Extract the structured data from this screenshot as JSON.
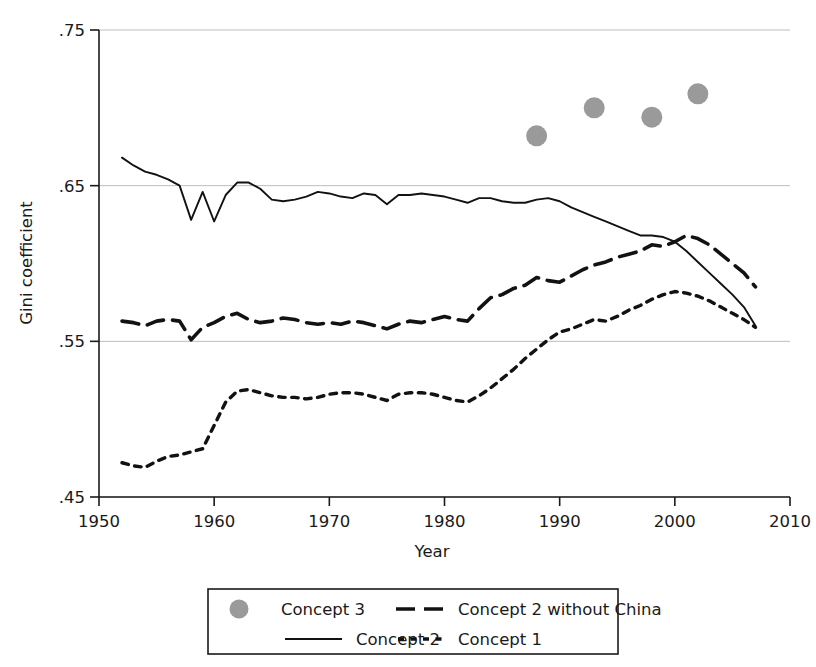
{
  "chart_data": {
    "type": "line",
    "title": "",
    "xlabel": "Year",
    "ylabel": "Gini coefficient",
    "xlim": [
      1950,
      2010
    ],
    "ylim": [
      0.45,
      0.75
    ],
    "xticks": [
      1950,
      1960,
      1970,
      1980,
      1990,
      2000,
      2010
    ],
    "xtick_labels": [
      "1950",
      "1960",
      "1970",
      "1980",
      "1990",
      "2000",
      "2010"
    ],
    "yticks": [
      0.45,
      0.55,
      0.65,
      0.75
    ],
    "ytick_labels": [
      ".45",
      ".55",
      ".65",
      ".75"
    ],
    "grid": "horizontal",
    "legend_position": "below-outside",
    "series": [
      {
        "name": "Concept 3",
        "kind": "scatter",
        "marker": "filled-circle",
        "color": "#9a9a9a",
        "x": [
          1988,
          1993,
          1998,
          2002
        ],
        "values": [
          0.682,
          0.7,
          0.694,
          0.709
        ]
      },
      {
        "name": "Concept 2 without China",
        "kind": "line",
        "style": "dashed",
        "color": "#121212",
        "x": [
          1952,
          1953,
          1954,
          1955,
          1956,
          1957,
          1958,
          1959,
          1960,
          1961,
          1962,
          1963,
          1964,
          1965,
          1966,
          1967,
          1968,
          1969,
          1970,
          1971,
          1972,
          1973,
          1974,
          1975,
          1976,
          1977,
          1978,
          1979,
          1980,
          1981,
          1982,
          1983,
          1984,
          1985,
          1986,
          1987,
          1988,
          1989,
          1990,
          1991,
          1992,
          1993,
          1994,
          1995,
          1996,
          1997,
          1998,
          1999,
          2000,
          2001,
          2002,
          2003,
          2004,
          2005,
          2006,
          2007
        ],
        "values": [
          0.563,
          0.562,
          0.56,
          0.563,
          0.564,
          0.563,
          0.551,
          0.559,
          0.562,
          0.566,
          0.568,
          0.564,
          0.562,
          0.563,
          0.565,
          0.564,
          0.562,
          0.561,
          0.562,
          0.561,
          0.563,
          0.562,
          0.56,
          0.558,
          0.561,
          0.563,
          0.562,
          0.564,
          0.566,
          0.564,
          0.563,
          0.571,
          0.578,
          0.58,
          0.584,
          0.586,
          0.591,
          0.589,
          0.588,
          0.592,
          0.596,
          0.599,
          0.601,
          0.604,
          0.606,
          0.608,
          0.612,
          0.611,
          0.614,
          0.618,
          0.616,
          0.612,
          0.606,
          0.6,
          0.594,
          0.585
        ]
      },
      {
        "name": "Concept 2",
        "kind": "line",
        "style": "solid",
        "color": "#121212",
        "x": [
          1952,
          1953,
          1954,
          1955,
          1956,
          1957,
          1958,
          1959,
          1960,
          1961,
          1962,
          1963,
          1964,
          1965,
          1966,
          1967,
          1968,
          1969,
          1970,
          1971,
          1972,
          1973,
          1974,
          1975,
          1976,
          1977,
          1978,
          1979,
          1980,
          1981,
          1982,
          1983,
          1984,
          1985,
          1986,
          1987,
          1988,
          1989,
          1990,
          1991,
          1992,
          1993,
          1994,
          1995,
          1996,
          1997,
          1998,
          1999,
          2000,
          2001,
          2002,
          2003,
          2004,
          2005,
          2006,
          2007
        ],
        "values": [
          0.668,
          0.663,
          0.659,
          0.657,
          0.654,
          0.65,
          0.628,
          0.646,
          0.627,
          0.644,
          0.652,
          0.652,
          0.648,
          0.641,
          0.64,
          0.641,
          0.643,
          0.646,
          0.645,
          0.643,
          0.642,
          0.645,
          0.644,
          0.638,
          0.644,
          0.644,
          0.645,
          0.644,
          0.643,
          0.641,
          0.639,
          0.642,
          0.642,
          0.64,
          0.639,
          0.639,
          0.641,
          0.642,
          0.64,
          0.636,
          0.633,
          0.63,
          0.627,
          0.624,
          0.621,
          0.618,
          0.618,
          0.617,
          0.614,
          0.608,
          0.601,
          0.594,
          0.587,
          0.58,
          0.572,
          0.56
        ]
      },
      {
        "name": "Concept 1",
        "kind": "line",
        "style": "dotted",
        "color": "#121212",
        "x": [
          1952,
          1953,
          1954,
          1955,
          1956,
          1957,
          1958,
          1959,
          1960,
          1961,
          1962,
          1963,
          1964,
          1965,
          1966,
          1967,
          1968,
          1969,
          1970,
          1971,
          1972,
          1973,
          1974,
          1975,
          1976,
          1977,
          1978,
          1979,
          1980,
          1981,
          1982,
          1983,
          1984,
          1985,
          1986,
          1987,
          1988,
          1989,
          1990,
          1991,
          1992,
          1993,
          1994,
          1995,
          1996,
          1997,
          1998,
          1999,
          2000,
          2001,
          2002,
          2003,
          2004,
          2005,
          2006,
          2007
        ],
        "values": [
          0.472,
          0.47,
          0.469,
          0.473,
          0.476,
          0.477,
          0.479,
          0.481,
          0.496,
          0.511,
          0.518,
          0.519,
          0.517,
          0.515,
          0.514,
          0.514,
          0.513,
          0.514,
          0.516,
          0.517,
          0.517,
          0.516,
          0.514,
          0.512,
          0.516,
          0.517,
          0.517,
          0.516,
          0.514,
          0.512,
          0.511,
          0.515,
          0.52,
          0.526,
          0.532,
          0.539,
          0.545,
          0.551,
          0.556,
          0.558,
          0.561,
          0.564,
          0.563,
          0.566,
          0.57,
          0.573,
          0.577,
          0.58,
          0.582,
          0.581,
          0.579,
          0.576,
          0.572,
          0.568,
          0.564,
          0.559
        ]
      }
    ]
  },
  "legend": {
    "entries": [
      {
        "label": "Concept 3",
        "swatch": "gray-dot-marker"
      },
      {
        "label": "Concept 2 without China",
        "swatch": "dashed-line"
      },
      {
        "label": "Concept 2",
        "swatch": "solid-line"
      },
      {
        "label": "Concept 1",
        "swatch": "dotted-line"
      }
    ]
  }
}
